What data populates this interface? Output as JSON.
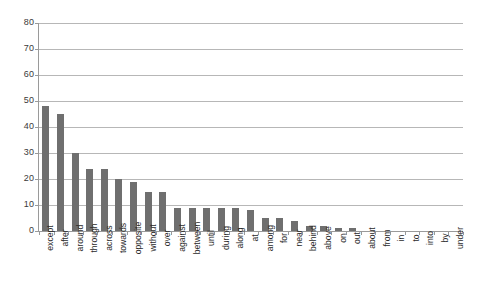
{
  "chart_data": {
    "type": "bar",
    "title": "",
    "subtitle": "",
    "xlabel": "",
    "ylabel": "",
    "ylim": [
      0,
      80
    ],
    "y_ticks": [
      0,
      10,
      20,
      30,
      40,
      50,
      60,
      70,
      80
    ],
    "grid": true,
    "legend": false,
    "legend_position": "none",
    "bar_color": "#6f6f6f",
    "gridline_color": "#b7b7b7",
    "axis_color": "#9a9a9a",
    "categories": [
      "except",
      "after",
      "around",
      "through",
      "across",
      "towards",
      "opposite",
      "without",
      "over",
      "against",
      "between",
      "until",
      "during",
      "along",
      "at",
      "among",
      "for",
      "near",
      "behind",
      "above",
      "on",
      "out",
      "about",
      "from",
      "in",
      "to",
      "into",
      "by",
      "under"
    ],
    "values": [
      48,
      45,
      30,
      24,
      24,
      20,
      19,
      15,
      15,
      9,
      9,
      9,
      9,
      9,
      8,
      5,
      5,
      4,
      2,
      2,
      1,
      1,
      0,
      0,
      0,
      0,
      0,
      0,
      0
    ]
  }
}
